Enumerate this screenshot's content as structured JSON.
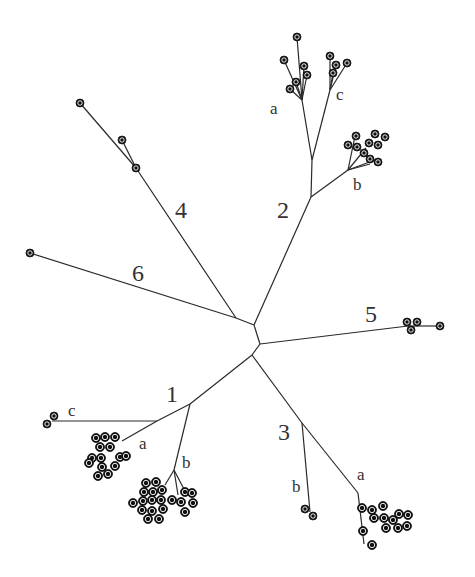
{
  "diagram": {
    "type": "unrooted phylogenetic tree",
    "clades": [
      {
        "id": "1",
        "label": "1",
        "subclades": [
          "a",
          "b",
          "c"
        ]
      },
      {
        "id": "2",
        "label": "2",
        "subclades": [
          "a",
          "b",
          "c"
        ]
      },
      {
        "id": "3",
        "label": "3",
        "subclades": [
          "a",
          "b"
        ]
      },
      {
        "id": "4",
        "label": "4",
        "subclades": []
      },
      {
        "id": "5",
        "label": "5",
        "subclades": []
      },
      {
        "id": "6",
        "label": "6",
        "subclades": []
      }
    ],
    "labels": {
      "c1": "1",
      "c1a": "a",
      "c1b": "b",
      "c1c": "c",
      "c2": "2",
      "c2a": "a",
      "c2b": "b",
      "c2c": "c",
      "c3": "3",
      "c3a": "a",
      "c3b": "b",
      "c4": "4",
      "c5": "5",
      "c6": "6"
    },
    "colors": {
      "edge": "#2a2a2a",
      "node": "#111111",
      "text": "#333333",
      "background": "#ffffff"
    }
  }
}
